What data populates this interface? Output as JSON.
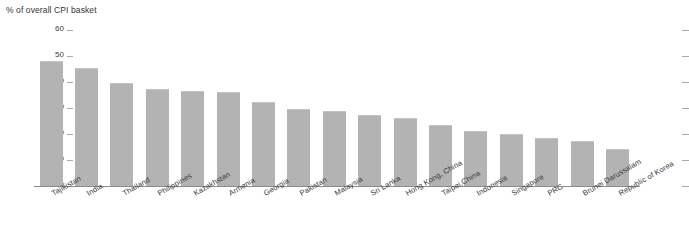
{
  "chart_data": {
    "type": "bar",
    "title": "% of overall CPI basket",
    "xlabel": "",
    "ylabel": "% of overall CPI basket",
    "ylim": [
      0,
      60
    ],
    "yticks": [
      0,
      10,
      20,
      30,
      40,
      50,
      60
    ],
    "grid": false,
    "legend": null,
    "bar_color": "#b3b3b3",
    "categories": [
      "Tajikistan",
      "India",
      "Thailand",
      "Philippines",
      "Kazakhstan",
      "Armenia",
      "Georgia",
      "Pakistan",
      "Malaysia",
      "Sri Lanka",
      "Hong Kong, China",
      "Taipei,China",
      "Indonesia",
      "Singapore",
      "PRC",
      "Brunei Darussalam",
      "Republic of Korea"
    ],
    "values": [
      48.0,
      45.5,
      39.5,
      37.5,
      36.5,
      36.3,
      32.5,
      29.8,
      28.7,
      27.5,
      26.2,
      23.5,
      21.3,
      20.0,
      18.5,
      17.5,
      14.3
    ]
  }
}
